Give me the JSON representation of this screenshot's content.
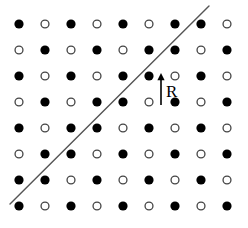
{
  "figure": {
    "width": 248,
    "height": 228,
    "background_color": "#ffffff"
  },
  "lattice": {
    "rows": 8,
    "columns": 9,
    "origin_x": 19,
    "origin_y": 24,
    "spacing_x": 26,
    "spacing_y": 26,
    "circle_radius": 4.6,
    "filled_color": "#000000",
    "open_fill_color": "#ffffff",
    "open_stroke_color": "#444444",
    "open_stroke_width": 1.3,
    "grid": [
      [
        "filled",
        "open",
        "filled",
        "open",
        "filled",
        "open",
        "filled",
        "filled",
        "open"
      ],
      [
        "open",
        "filled",
        "open",
        "filled",
        "open",
        "filled",
        "filled",
        "open",
        "filled"
      ],
      [
        "filled",
        "open",
        "filled",
        "open",
        "filled",
        "filled",
        "open",
        "filled",
        "open"
      ],
      [
        "open",
        "filled",
        "open",
        "filled",
        "filled",
        "open",
        "filled",
        "open",
        "filled"
      ],
      [
        "filled",
        "open",
        "filled",
        "filled",
        "open",
        "filled",
        "open",
        "filled",
        "open"
      ],
      [
        "open",
        "filled",
        "filled",
        "open",
        "filled",
        "open",
        "filled",
        "open",
        "filled"
      ],
      [
        "filled",
        "filled",
        "open",
        "filled",
        "open",
        "filled",
        "open",
        "filled",
        "open"
      ],
      [
        "filled",
        "open",
        "filled",
        "open",
        "filled",
        "open",
        "filled",
        "open",
        "filled"
      ]
    ]
  },
  "boundary_line": {
    "x1": 10,
    "y1": 204,
    "x2": 209,
    "y2": 6,
    "color": "#555555",
    "width": 1.4
  },
  "vector_arrow": {
    "tail_x": 161,
    "tail_y": 105,
    "head_x": 161,
    "head_y": 73,
    "color": "#000000",
    "width": 1.6,
    "head_size": 5
  },
  "vector_label": {
    "text": "R",
    "x": 166,
    "y": 83,
    "color": "#000000"
  }
}
